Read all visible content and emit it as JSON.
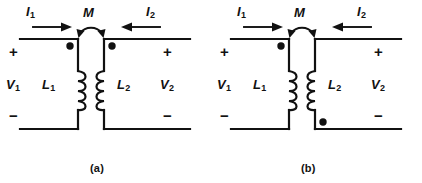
{
  "figure": {
    "background_color": "#ffffff",
    "ink_color": "#111111",
    "panels": [
      {
        "id": "a",
        "caption": "(a)",
        "labels": {
          "current_left": "I",
          "current_left_sub": "1",
          "current_right": "I",
          "current_right_sub": "2",
          "mutual": "M",
          "polarity_top_left": "+",
          "polarity_bottom_left": "−",
          "polarity_top_right": "+",
          "polarity_bottom_right": "−",
          "voltage_left": "V",
          "voltage_left_sub": "1",
          "voltage_right": "V",
          "voltage_right_sub": "2",
          "inductor_left": "L",
          "inductor_left_sub": "1",
          "inductor_right": "L",
          "inductor_right_sub": "2"
        },
        "dots": [
          {
            "name": "dot-primary",
            "side": "left-coil",
            "position": "top"
          },
          {
            "name": "dot-secondary",
            "side": "right-coil",
            "position": "top"
          }
        ],
        "current_directions": {
          "left": "right",
          "right": "left"
        }
      },
      {
        "id": "b",
        "caption": "(b)",
        "labels": {
          "current_left": "I",
          "current_left_sub": "1",
          "current_right": "I",
          "current_right_sub": "2",
          "mutual": "M",
          "polarity_top_left": "+",
          "polarity_bottom_left": "−",
          "polarity_top_right": "+",
          "polarity_bottom_right": "−",
          "voltage_left": "V",
          "voltage_left_sub": "1",
          "voltage_right": "V",
          "voltage_right_sub": "2",
          "inductor_left": "L",
          "inductor_left_sub": "1",
          "inductor_right": "L",
          "inductor_right_sub": "2"
        },
        "dots": [
          {
            "name": "dot-primary",
            "side": "left-coil",
            "position": "top"
          },
          {
            "name": "dot-secondary",
            "side": "right-coil",
            "position": "bottom"
          }
        ],
        "current_directions": {
          "left": "right",
          "right": "left"
        }
      }
    ]
  }
}
